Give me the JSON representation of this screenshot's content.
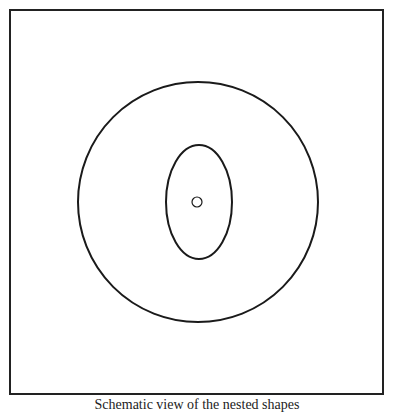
{
  "diagram": {
    "frame": {
      "x": 10,
      "y": 10,
      "width": 373,
      "height": 384,
      "stroke": "#222222"
    },
    "outer_circle": {
      "cx": 198,
      "cy": 202,
      "r": 120
    },
    "inner_ellipse": {
      "cx": 199,
      "cy": 202,
      "rx": 33,
      "ry": 57
    },
    "center_circle": {
      "cx": 197,
      "cy": 202,
      "r": 5
    },
    "stroke_color": "#1a1a1a"
  },
  "caption": "Schematic view of the nested shapes"
}
